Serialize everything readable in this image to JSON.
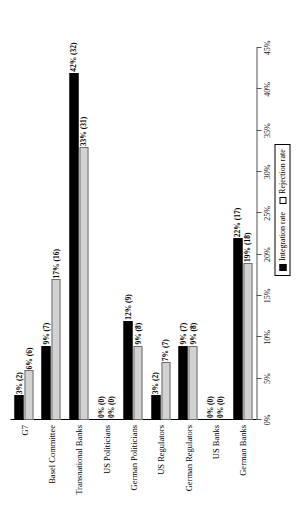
{
  "chart_data": {
    "type": "bar",
    "orientation": "horizontal",
    "title": "",
    "subtitle": "",
    "xlabel": "",
    "ylabel": "",
    "xlim": [
      0,
      45
    ],
    "grid": false,
    "legend_position": "bottom-right",
    "axis_ticks": [
      "0%",
      "5%",
      "10%",
      "15%",
      "20%",
      "25%",
      "30%",
      "35%",
      "40%",
      "45%"
    ],
    "axis_tick_values": [
      0,
      5,
      10,
      15,
      20,
      25,
      30,
      35,
      40,
      45
    ],
    "categories": [
      "G7",
      "Basel Committee",
      "Transnational Banks",
      "US Politicians",
      "German Politicians",
      "US Regulators",
      "German Regulators",
      "US Banks",
      "German Banks"
    ],
    "series": [
      {
        "name": "Integration rate",
        "color": "#000000",
        "values": [
          3,
          9,
          42,
          0,
          12,
          3,
          9,
          0,
          22
        ],
        "counts": [
          2,
          7,
          32,
          0,
          9,
          2,
          7,
          0,
          17
        ],
        "labels": [
          "3% (2)",
          "9% (7)",
          "42% (32)",
          "0% (0)",
          "12% (9)",
          "3% (2)",
          "9% (7)",
          "0% (0)",
          "22% (17)"
        ]
      },
      {
        "name": "Rejection rate",
        "color": "#d2d2d2",
        "values": [
          6,
          17,
          33,
          0,
          9,
          7,
          9,
          0,
          19
        ],
        "counts": [
          6,
          16,
          31,
          0,
          8,
          7,
          8,
          0,
          18
        ],
        "labels": [
          "6% (6)",
          "17% (16)",
          "33% (31)",
          "0% (0)",
          "9% (8)",
          "7% (7)",
          "9% (8)",
          "0% (0)",
          "19% (18)"
        ]
      }
    ]
  },
  "legend": {
    "items": [
      {
        "label": "Integration rate"
      },
      {
        "label": "Rejection rate"
      }
    ]
  }
}
